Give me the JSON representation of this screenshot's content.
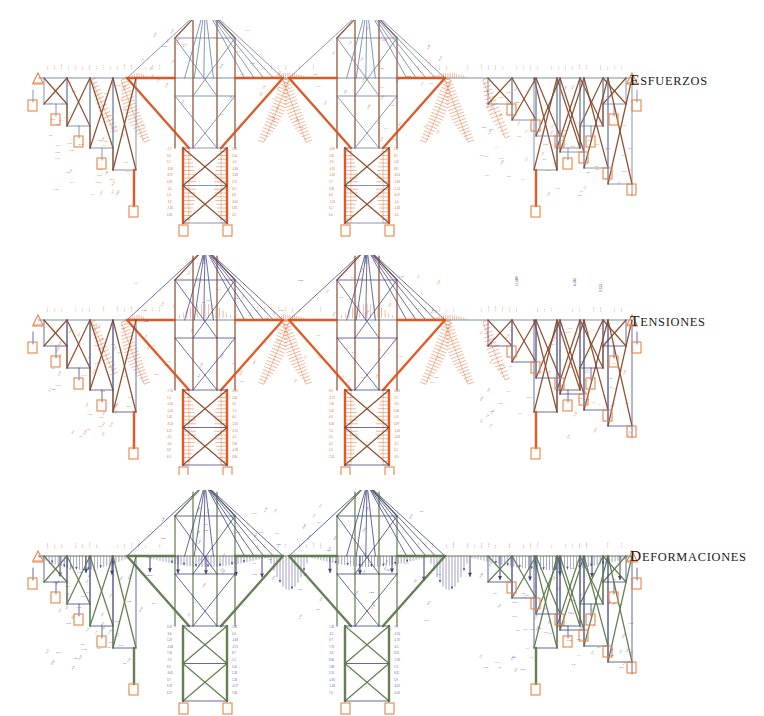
{
  "figure": {
    "title_visible": false,
    "background": "#ffffff",
    "panel_count": 3
  },
  "panels": [
    {
      "id": "esfuerzos",
      "label": "Esfuerzos",
      "label_first_letter": "E",
      "label_rest": "SFUERZOS",
      "y_top": 20,
      "height": 220,
      "deck_y": 78,
      "palette": {
        "member_tension": "#d9541f",
        "member_compression": "#6b7fa3",
        "member_dark": "#8a4a2a",
        "diagram_fill": "#e2682a",
        "support_box": "#e8864a",
        "text_value": "#d2682e",
        "text_value_alt": "#4b5b86",
        "deck_line": "#7d8fae"
      },
      "annotation_color": "#d2682e",
      "result_kind": "axial-force",
      "value_labels_visible": true
    },
    {
      "id": "tensiones",
      "label": "Tensiones",
      "label_first_letter": "T",
      "label_rest": "ENSIONES",
      "y_top": 255,
      "height": 220,
      "deck_y": 320,
      "palette": {
        "member_tension": "#e2521a",
        "member_compression": "#4b4e86",
        "member_dark": "#8a4a2a",
        "diagram_fill": "#e2682a",
        "support_box": "#e8864a",
        "text_value": "#d2682e",
        "text_value_alt": "#4a4e8c",
        "deck_line": "#7d8fae"
      },
      "annotation_color": "#d2682e",
      "result_kind": "stress",
      "value_labels_visible": true
    },
    {
      "id": "deformaciones",
      "label": "Deformaciones",
      "label_first_letter": "D",
      "label_rest": "EFORMACIONES",
      "y_top": 490,
      "height": 226,
      "deck_y": 556,
      "palette": {
        "member_tension": "#5f7a4a",
        "member_compression": "#41457e",
        "member_dark": "#4a5560",
        "diagram_fill": "#4d4f8e",
        "support_box": "#e8864a",
        "text_value": "#5a5f96",
        "text_value_alt": "#41457e",
        "deck_line": "#6f7a56"
      },
      "annotation_color": "#5a5f96",
      "result_kind": "displacement",
      "value_labels_visible": true
    }
  ],
  "structure": {
    "name": "cantilever-truss-bridge",
    "deck_left_x": 38,
    "deck_right_x": 632,
    "towers": [
      {
        "id": "tower-1",
        "center_x": 205,
        "base_y_offset": 145
      },
      {
        "id": "tower-2",
        "center_x": 367,
        "base_y_offset": 145
      }
    ],
    "approach_left": {
      "start_x": 38,
      "end_x": 128
    },
    "approach_right": {
      "start_x": 470,
      "end_x": 632
    },
    "suspended_span_left": {
      "start_x": 128,
      "end_x": 148
    },
    "suspended_span_center": {
      "start_x": 265,
      "end_x": 310
    },
    "suspended_span_right": {
      "start_x": 425,
      "end_x": 470
    }
  },
  "chart_data": {
    "type": "diagram",
    "panels": [
      "Esfuerzos",
      "Tensiones",
      "Deformaciones"
    ],
    "annotations": "numeric member result labels rendered alongside each bar"
  }
}
